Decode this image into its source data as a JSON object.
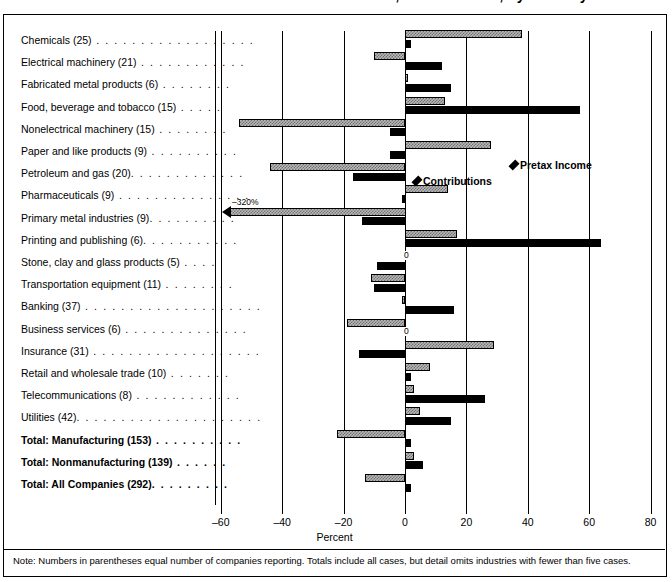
{
  "title": "Charitable Contributions and Pretax Income, 2003 vs. 2002, by industry",
  "axis": {
    "xlabel": "Percent",
    "ticks": [
      -60,
      -40,
      -20,
      0,
      20,
      40,
      60,
      80
    ],
    "xmin": -60,
    "xmax": 80
  },
  "legend": {
    "income_label": "Pretax Income",
    "contrib_label": "Contributions",
    "income_color": "#b9b9b9",
    "contrib_color": "#000000"
  },
  "note": "Note: Numbers in parentheses equal number of companies reporting.  Totals include all cases, but detail omits industries with fewer than five cases.",
  "overflow_marker": "-320%",
  "zero_marker": "0",
  "chart_data": {
    "type": "bar",
    "xlabel": "Percent",
    "ylabel": "",
    "xlim": [
      -60,
      80
    ],
    "grid": true,
    "legend_position": "inline-callout",
    "orientation": "horizontal",
    "categories": [
      "Chemicals (25)",
      "Electrical machinery (21)",
      "Fabricated metal products (6)",
      "Food, beverage and tobacco (15)",
      "Nonelectrical machinery (15)",
      "Paper and like products (9)",
      "Petroleum and gas (20)",
      "Pharmaceuticals (9)",
      "Primary metal industries (9)",
      "Printing and publishing (6)",
      "Stone, clay and glass products (5)",
      "Transportation equipment (11)",
      "Banking (37)",
      "Business services (6)",
      "Insurance (31)",
      "Retail and wholesale trade (10)",
      "Telecommunications (8)",
      "Utilities (42)",
      "Total: Manufacturing (153)",
      "Total: Nonmanufacturing (139)",
      "Total: All Companies (292)"
    ],
    "series": [
      {
        "name": "Pretax Income",
        "values": [
          38,
          -10,
          1,
          13,
          -54,
          28,
          -44,
          14,
          -320,
          17,
          0,
          -11,
          -1,
          -19,
          29,
          8,
          3,
          5,
          -22,
          3,
          -13
        ]
      },
      {
        "name": "Contributions",
        "values": [
          2,
          12,
          15,
          57,
          -5,
          -5,
          -17,
          -1,
          -14,
          64,
          -9,
          -10,
          16,
          0,
          -15,
          2,
          26,
          15,
          2,
          6,
          2
        ]
      }
    ]
  },
  "rows": [
    {
      "label": "Chemicals (25)",
      "dots": " . . . . . . . . . . . . . . . . . .",
      "bold": false,
      "income": 38,
      "contrib": 2
    },
    {
      "label": "Electrical machinery (21)",
      "dots": " . . . . . . . . . . . .",
      "bold": false,
      "income": -10,
      "contrib": 12
    },
    {
      "label": "Fabricated metal products (6)",
      "dots": " . . . . . . . .",
      "bold": false,
      "income": 1,
      "contrib": 15
    },
    {
      "label": "Food, beverage and tobacco (15)",
      "dots": " . . . . .",
      "bold": false,
      "income": 13,
      "contrib": 57
    },
    {
      "label": "Nonelectrical machinery (15)",
      "dots": " . . . . . . . .",
      "bold": false,
      "income": -54,
      "contrib": -5
    },
    {
      "label": "Paper and like products (9)",
      "dots": " . . . . . . . . . .",
      "bold": false,
      "income": 28,
      "contrib": -5
    },
    {
      "label": "Petroleum and gas (20)",
      "dots": ". . . . . . . . . . . . .",
      "bold": false,
      "income": -44,
      "contrib": -17
    },
    {
      "label": "Pharmaceuticals (9)",
      "dots": " . . . . . . . . . . . . . . .",
      "bold": false,
      "income": 14,
      "contrib": -1
    },
    {
      "label": "Primary metal industries (9)",
      "dots": ". . . . . . . . . .",
      "bold": false,
      "income": -320,
      "contrib": -14
    },
    {
      "label": "Printing and publishing (6)",
      "dots": ". . . . . . . . . . .",
      "bold": false,
      "income": 17,
      "contrib": 64
    },
    {
      "label": "Stone, clay and glass products (5)",
      "dots": " . . . .",
      "bold": false,
      "income": 0,
      "contrib": -9
    },
    {
      "label": "Transportation equipment (11)",
      "dots": " . . . . . . . .",
      "bold": false,
      "income": -11,
      "contrib": -10
    },
    {
      "label": "Banking (37)",
      "dots": " . . . . . . . . . . . . . . . . . . . .",
      "bold": false,
      "income": -1,
      "contrib": 16
    },
    {
      "label": "Business services (6)",
      "dots": " . . . . . . . . . . . . . .",
      "bold": false,
      "income": -19,
      "contrib": 0
    },
    {
      "label": "Insurance (31)",
      "dots": " . . . . . . . . . . . . . . . . . . .",
      "bold": false,
      "income": 29,
      "contrib": -15
    },
    {
      "label": "Retail and wholesale trade (10)",
      "dots": " . . . . . . .",
      "bold": false,
      "income": 8,
      "contrib": 2
    },
    {
      "label": "Telecommunications (8)",
      "dots": " . . . . . . . . . . . .",
      "bold": false,
      "income": 3,
      "contrib": 26
    },
    {
      "label": "Utilities (42)",
      "dots": ". . . . . . . . . . . . . . . . . . . . .",
      "bold": false,
      "income": 5,
      "contrib": 15
    },
    {
      "label": "Total: Manufacturing (153)",
      "dots": " . . . . . . . . . .",
      "bold": true,
      "income": -22,
      "contrib": 2
    },
    {
      "label": "Total: Nonmanufacturing (139)",
      "dots": " . . . . . .",
      "bold": true,
      "income": 3,
      "contrib": 6
    },
    {
      "label": "Total: All Companies (292)",
      "dots": ". . . . . . . . .",
      "bold": true,
      "income": -13,
      "contrib": 2
    }
  ]
}
